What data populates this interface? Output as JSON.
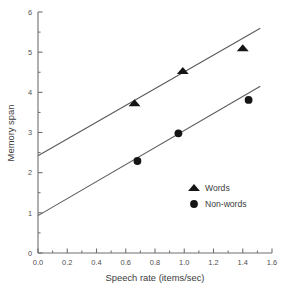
{
  "chart_data": {
    "type": "scatter",
    "title": "",
    "xlabel": "Speech rate (items/sec)",
    "ylabel": "Memory span",
    "xlim": [
      0.0,
      1.6
    ],
    "ylim": [
      0,
      6
    ],
    "xticks": [
      "0.0",
      "0.2",
      "0.4",
      "0.6",
      "0.8",
      "1.0",
      "1.2",
      "1.4",
      "1.6"
    ],
    "xtick_values": [
      0.0,
      0.2,
      0.4,
      0.6,
      0.8,
      1.0,
      1.2,
      1.4,
      1.6
    ],
    "yticks": [
      "0",
      "1",
      "2",
      "3",
      "4",
      "5",
      "6"
    ],
    "ytick_values": [
      0,
      1,
      2,
      3,
      4,
      5,
      6
    ],
    "minor_ticks": true,
    "grid": false,
    "legend_position": "center-right",
    "series": [
      {
        "name": "Words",
        "marker": "triangle",
        "color": "#151515",
        "points": [
          {
            "x": 0.66,
            "y": 3.73
          },
          {
            "x": 0.99,
            "y": 4.53
          },
          {
            "x": 1.4,
            "y": 5.1
          }
        ],
        "fit_line": {
          "intercept": 2.42,
          "slope": 2.09,
          "x_start": 0.0,
          "x_end": 1.52
        }
      },
      {
        "name": "Non-words",
        "marker": "circle",
        "color": "#151515",
        "points": [
          {
            "x": 0.68,
            "y": 2.29
          },
          {
            "x": 0.96,
            "y": 2.98
          },
          {
            "x": 1.44,
            "y": 3.81
          }
        ],
        "fit_line": {
          "intercept": 0.93,
          "slope": 2.12,
          "x_start": 0.0,
          "x_end": 1.52
        }
      }
    ],
    "legend": [
      {
        "label": "Words",
        "marker": "triangle"
      },
      {
        "label": "Non-words",
        "marker": "circle"
      }
    ]
  }
}
